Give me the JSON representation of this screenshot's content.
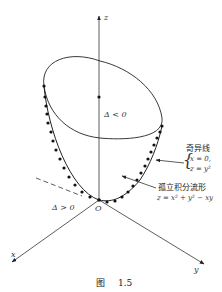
{
  "figure": {
    "caption_prefix": "图",
    "caption_number": "1.5"
  },
  "axes": {
    "x_label": "x",
    "y_label": "y",
    "z_label": "z",
    "origin_label": "O"
  },
  "regions": {
    "inner_label": "Δ < 0",
    "outer_label": "Δ > 0"
  },
  "annotations": {
    "singular_line": {
      "title": "奇异线",
      "eq1": "x = 0,",
      "eq2": "z = y²"
    },
    "isolated_manifold": {
      "title": "孤立积分流形",
      "eq": "z = x² + y² − xy"
    }
  },
  "colors": {
    "stroke": "#222222",
    "background": "#ffffff"
  }
}
